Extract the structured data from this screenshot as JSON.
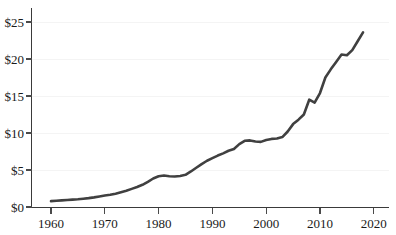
{
  "chart_data": {
    "type": "line",
    "title": "",
    "subtitle": "",
    "xlabel": "",
    "ylabel": "",
    "xlim": [
      1958,
      2021
    ],
    "ylim": [
      0,
      26.5
    ],
    "grid": "horizontal",
    "legend": "none",
    "y_tick_labels": [
      "$0",
      "$5",
      "$10",
      "$15",
      "$20",
      "$25"
    ],
    "y_tick_values": [
      0,
      5,
      10,
      15,
      20,
      25
    ],
    "x_tick_labels": [
      "1960",
      "1970",
      "1980",
      "1990",
      "2000",
      "2010",
      "2020"
    ],
    "x_tick_values": [
      1960,
      1970,
      1980,
      1990,
      2000,
      2010,
      2020
    ],
    "line_color": "#404040",
    "grid_color": "#f4f4f4",
    "axis_color": "#3a3a3a",
    "series": [
      {
        "name": "value",
        "x": [
          1960,
          1961,
          1962,
          1963,
          1964,
          1965,
          1966,
          1967,
          1968,
          1969,
          1970,
          1971,
          1972,
          1973,
          1974,
          1975,
          1976,
          1977,
          1978,
          1979,
          1980,
          1981,
          1982,
          1983,
          1984,
          1985,
          1986,
          1987,
          1988,
          1989,
          1990,
          1991,
          1992,
          1993,
          1994,
          1995,
          1996,
          1997,
          1998,
          1999,
          2000,
          2001,
          2002,
          2003,
          2004,
          2005,
          2006,
          2007,
          2008,
          2009,
          2010,
          2011,
          2012,
          2013,
          2014,
          2015,
          2016,
          2017,
          2018
        ],
        "values": [
          0.8,
          0.85,
          0.9,
          0.95,
          1.0,
          1.05,
          1.12,
          1.2,
          1.3,
          1.42,
          1.55,
          1.65,
          1.8,
          2.0,
          2.2,
          2.45,
          2.7,
          3.0,
          3.4,
          3.85,
          4.15,
          4.25,
          4.15,
          4.12,
          4.2,
          4.35,
          4.8,
          5.3,
          5.8,
          6.25,
          6.6,
          6.95,
          7.25,
          7.6,
          7.85,
          8.5,
          8.95,
          9.0,
          8.85,
          8.8,
          9.05,
          9.2,
          9.25,
          9.45,
          10.2,
          11.2,
          11.8,
          12.5,
          14.5,
          14.1,
          15.4,
          17.5,
          18.6,
          19.6,
          20.6,
          20.5,
          21.2,
          22.4,
          23.6
        ]
      }
    ]
  },
  "axes": {
    "y_axis_name": "dollar-value-axis",
    "x_axis_name": "year-axis"
  }
}
